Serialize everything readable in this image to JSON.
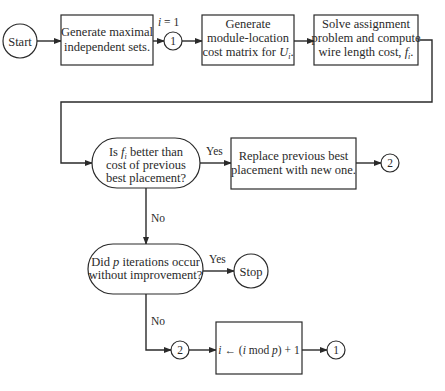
{
  "flowchart": {
    "start": "Start",
    "stop": "Stop",
    "connector_1": "1",
    "connector_2": "2",
    "yes": "Yes",
    "no": "No",
    "init_label": {
      "var": "i",
      "rest": " = 1"
    },
    "generate_sets": {
      "line1": "Generate maximal",
      "line2": "independent sets."
    },
    "cost_matrix": {
      "line1": "Generate",
      "line2": "module-location",
      "line3_prefix": "cost matrix for ",
      "var": "U",
      "sub": "i",
      "suffix": "."
    },
    "solve_assignment": {
      "line1": "Solve assignment",
      "line2": "problem and compute",
      "line3_prefix": "wire length cost, ",
      "var": "f",
      "sub": "i",
      "suffix": "."
    },
    "decision_better": {
      "line1_prefix": "Is ",
      "var": "f",
      "sub": "i",
      "line1_suffix": " better than",
      "line2": "cost of previous",
      "line3": "best placement?"
    },
    "replace_best": {
      "line1": "Replace previous best",
      "line2": "placement with new one."
    },
    "decision_iterations": {
      "line1_prefix": "Did ",
      "var": "p",
      "line1_suffix": " iterations occur",
      "line2": "without improvement?"
    },
    "update_index": {
      "var1": "i",
      "arrow": " ← (",
      "var2": "i",
      "mod": " mod ",
      "var3": "p",
      "rest": ") + 1"
    }
  }
}
